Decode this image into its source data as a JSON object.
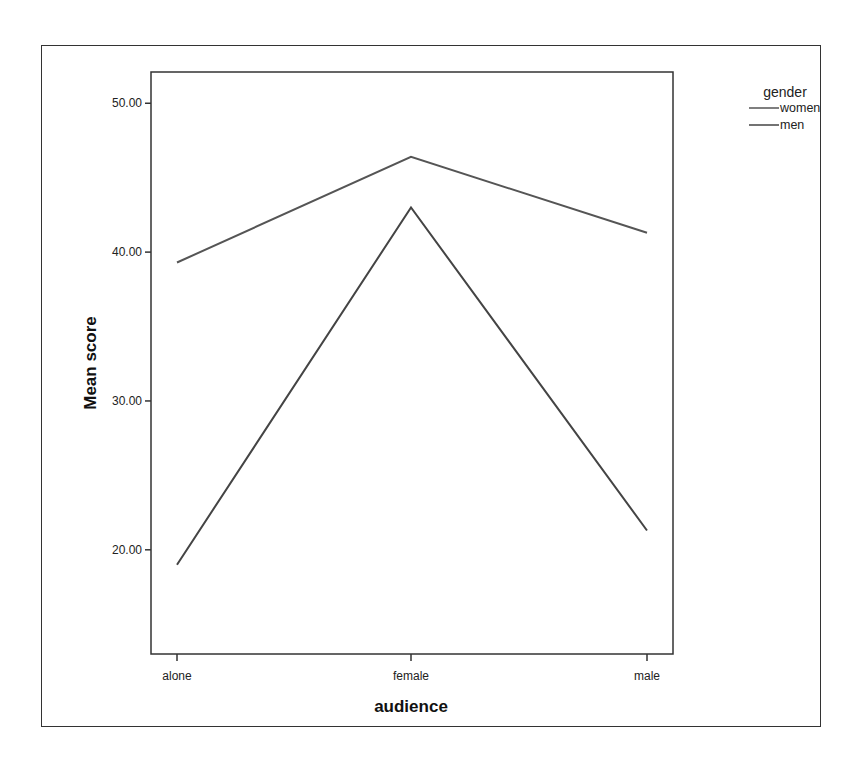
{
  "chart_data": {
    "type": "line",
    "title": "",
    "xlabel": "audience",
    "ylabel": "Mean score",
    "categories": [
      "alone",
      "female",
      "male"
    ],
    "series": [
      {
        "name": "women",
        "values": [
          39.3,
          46.4,
          41.3
        ],
        "color": "#555555"
      },
      {
        "name": "men",
        "values": [
          19.0,
          43.0,
          21.3
        ],
        "color": "#444444"
      }
    ],
    "yticks": [
      20,
      30,
      40,
      50
    ],
    "ytick_labels": [
      "20.00",
      "30.00",
      "40.00",
      "50.00"
    ],
    "ylim": [
      13.0,
      52.1
    ],
    "grid": false,
    "legend": {
      "title": "gender",
      "position": "top-right-outside",
      "entries": [
        "women",
        "men"
      ]
    }
  }
}
